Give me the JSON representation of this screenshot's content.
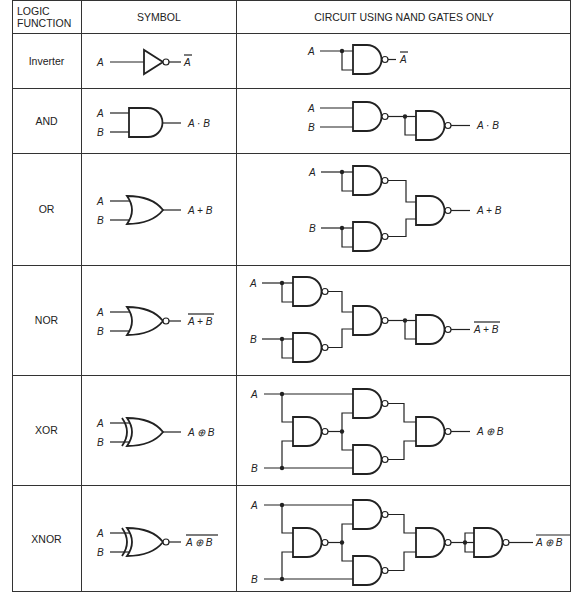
{
  "header": {
    "col1": "LOGIC FUNCTION",
    "col1_line1": "LOGIC",
    "col1_line2": "FUNCTION",
    "col2": "SYMBOL",
    "col3": "CIRCUIT USING NAND GATES ONLY"
  },
  "rows": [
    {
      "function": "Inverter",
      "symbol": "inverter-gate",
      "inputs": [
        "A"
      ],
      "output": "Ā",
      "output_text": "A",
      "output_overline": true,
      "nand_gate_count": 1
    },
    {
      "function": "AND",
      "symbol": "and-gate",
      "inputs": [
        "A",
        "B"
      ],
      "output": "A · B",
      "output_text": "A · B",
      "output_overline": false,
      "nand_gate_count": 2
    },
    {
      "function": "OR",
      "symbol": "or-gate",
      "inputs": [
        "A",
        "B"
      ],
      "output": "A + B",
      "output_text": "A + B",
      "output_overline": false,
      "nand_gate_count": 3
    },
    {
      "function": "NOR",
      "symbol": "nor-gate",
      "inputs": [
        "A",
        "B"
      ],
      "output": "‾(A + B)",
      "output_text": "A + B",
      "output_overline": true,
      "nand_gate_count": 4
    },
    {
      "function": "XOR",
      "symbol": "xor-gate",
      "inputs": [
        "A",
        "B"
      ],
      "output": "A ⊕ B",
      "output_text": "A ⊕ B",
      "output_overline": false,
      "nand_gate_count": 4
    },
    {
      "function": "XNOR",
      "symbol": "xnor-gate",
      "inputs": [
        "A",
        "B"
      ],
      "output": "‾(A ⊕ B)",
      "output_text": "A ⊕ B",
      "output_overline": true,
      "nand_gate_count": 5
    }
  ],
  "labels": {
    "a": "A",
    "b": "B"
  }
}
